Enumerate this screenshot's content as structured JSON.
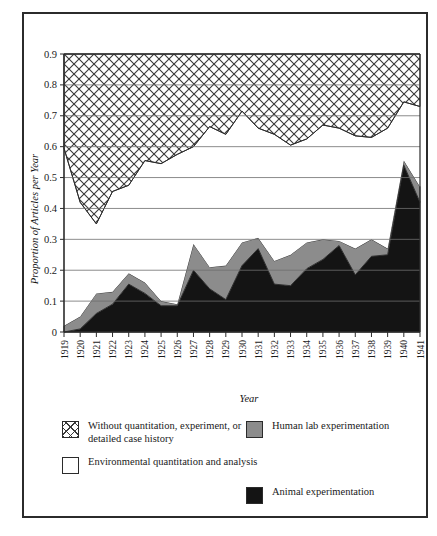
{
  "figure": {
    "caption_partial": "",
    "background_color": "#ffffff",
    "frame_color": "#2b2b2b"
  },
  "colors": {
    "hatch_stroke": "#3a3a3a",
    "white_band": "#ffffff",
    "gray_band": "#8c8c8c",
    "black_band": "#141414",
    "gridline": "#6e6e6e",
    "axis": "#2b2b2b"
  },
  "legend": {
    "position": "below-plot",
    "entries": [
      {
        "id": "without-quantitation",
        "swatch": "crosshatch",
        "label": "Without quantitation, experiment, or detailed case history"
      },
      {
        "id": "environmental-quantitation",
        "swatch": "white",
        "label": "Environmental quantitation and analysis"
      },
      {
        "id": "human-lab",
        "swatch": "gray",
        "label": "Human lab experimentation"
      },
      {
        "id": "animal-experimentation",
        "swatch": "black",
        "label": "Animal experimentation"
      }
    ]
  },
  "chart_data": {
    "type": "area",
    "stacked": true,
    "title": "",
    "xlabel": "Year",
    "ylabel": "Proportion of Articles per Year",
    "grid": true,
    "legend_position": "bottom",
    "xlim": [
      1919,
      1941
    ],
    "ylim": [
      0,
      0.9
    ],
    "yticks": [
      0,
      0.1,
      0.2,
      0.3,
      0.4,
      0.5,
      0.6,
      0.7,
      0.8,
      0.9
    ],
    "ytick_labels": [
      "0",
      "0.1",
      "0.2",
      "0.3",
      "0.4",
      "0.5",
      "0.6",
      "0.7",
      "0.8",
      "0.9"
    ],
    "categories": [
      1919,
      1920,
      1921,
      1922,
      1923,
      1924,
      1925,
      1926,
      1927,
      1928,
      1929,
      1930,
      1931,
      1932,
      1933,
      1934,
      1935,
      1936,
      1937,
      1938,
      1939,
      1940,
      1941
    ],
    "xtick_labels": [
      "1919",
      "1920",
      "1921",
      "1922",
      "1923",
      "1924",
      "1925",
      "1926",
      "1927",
      "1928",
      "1929",
      "1930",
      "1931",
      "1932",
      "1933",
      "1934",
      "1935",
      "1936",
      "1937",
      "1938",
      "1939",
      "1940",
      "1941"
    ],
    "series": [
      {
        "name": "Animal experimentation",
        "key": "animal",
        "color": "#141414",
        "fill": "solid-black",
        "values": [
          0.0,
          0.01,
          0.06,
          0.09,
          0.155,
          0.125,
          0.085,
          0.085,
          0.2,
          0.14,
          0.105,
          0.215,
          0.27,
          0.155,
          0.15,
          0.205,
          0.235,
          0.28,
          0.185,
          0.245,
          0.25,
          0.54,
          0.42
        ]
      },
      {
        "name": "Human lab experimentation",
        "key": "human_lab",
        "color": "#8c8c8c",
        "fill": "solid-gray",
        "values": [
          0.02,
          0.04,
          0.065,
          0.04,
          0.035,
          0.035,
          0.015,
          0.005,
          0.085,
          0.07,
          0.11,
          0.075,
          0.035,
          0.075,
          0.1,
          0.085,
          0.065,
          0.015,
          0.085,
          0.055,
          0.02,
          0.015,
          0.05
        ]
      },
      {
        "name": "Environmental quantitation and analysis",
        "key": "environmental",
        "color": "#ffffff",
        "fill": "white",
        "values": [
          0.575,
          0.37,
          0.225,
          0.325,
          0.285,
          0.395,
          0.445,
          0.485,
          0.315,
          0.455,
          0.425,
          0.425,
          0.355,
          0.41,
          0.355,
          0.335,
          0.37,
          0.365,
          0.365,
          0.33,
          0.39,
          0.19,
          0.26
        ]
      },
      {
        "name": "Without quantitation, experiment, or detailed case history",
        "key": "without_quantitation",
        "color": "#ffffff",
        "fill": "crosshatch",
        "values": [
          0.405,
          0.58,
          0.655,
          0.545,
          0.525,
          0.445,
          0.455,
          0.425,
          0.4,
          0.335,
          0.36,
          0.285,
          0.34,
          0.36,
          0.395,
          0.375,
          0.33,
          0.34,
          0.365,
          0.37,
          0.34,
          0.255,
          0.27
        ]
      }
    ],
    "cumulative_tops": {
      "animal": [
        0.0,
        0.01,
        0.06,
        0.09,
        0.155,
        0.125,
        0.085,
        0.085,
        0.2,
        0.14,
        0.105,
        0.215,
        0.27,
        0.155,
        0.15,
        0.205,
        0.235,
        0.28,
        0.185,
        0.245,
        0.25,
        0.54,
        0.42
      ],
      "human_lab": [
        0.02,
        0.05,
        0.125,
        0.13,
        0.19,
        0.16,
        0.1,
        0.09,
        0.285,
        0.21,
        0.215,
        0.29,
        0.305,
        0.23,
        0.25,
        0.29,
        0.3,
        0.295,
        0.27,
        0.3,
        0.27,
        0.555,
        0.47
      ],
      "environmental": [
        0.595,
        0.42,
        0.35,
        0.455,
        0.475,
        0.555,
        0.545,
        0.575,
        0.6,
        0.665,
        0.64,
        0.715,
        0.66,
        0.64,
        0.605,
        0.625,
        0.67,
        0.66,
        0.635,
        0.63,
        0.66,
        0.745,
        0.73
      ],
      "without_quantitation": [
        1.0,
        1.0,
        1.0,
        1.0,
        1.0,
        1.0,
        1.0,
        1.0,
        1.0,
        1.0,
        1.0,
        1.0,
        1.0,
        1.0,
        1.0,
        1.0,
        1.0,
        1.0,
        1.0,
        1.0,
        1.0,
        1.0,
        1.0
      ]
    }
  }
}
